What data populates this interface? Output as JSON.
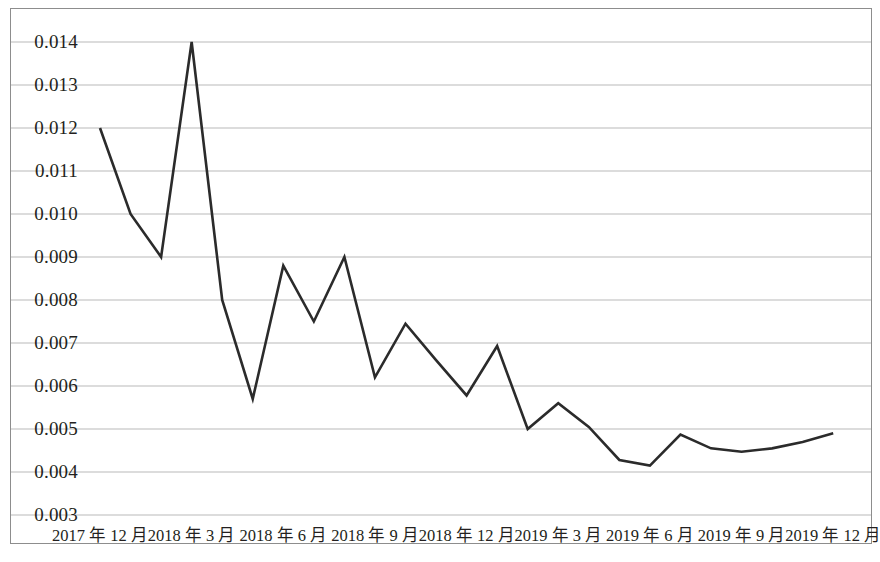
{
  "chart_data": {
    "type": "line",
    "title": "",
    "subtitle": "",
    "xlabel": "",
    "ylabel": "",
    "grid": true,
    "legend": "none",
    "ylim": [
      0.003,
      0.0145
    ],
    "ytick_labels": [
      "0.014",
      "0.013",
      "0.012",
      "0.011",
      "0.010",
      "0.009",
      "0.008",
      "0.007",
      "0.006",
      "0.005",
      "0.004",
      "0.003"
    ],
    "ytick_values": [
      0.014,
      0.013,
      0.012,
      0.011,
      0.01,
      0.009,
      0.008,
      0.007,
      0.006,
      0.005,
      0.004,
      0.003
    ],
    "xtick_labels": [
      "2017 年 12 月",
      "2018 年 3 月",
      "2018 年 6 月",
      "2018 年 9 月",
      "2018 年 12 月",
      "2019 年 3 月",
      "2019 年 6 月",
      "2019 年 9 月",
      "2019 年 12 月"
    ],
    "xtick_indices": [
      0,
      3,
      6,
      9,
      12,
      15,
      18,
      21,
      24
    ],
    "x": [
      "2017-12",
      "2018-01",
      "2018-02",
      "2018-03",
      "2018-04",
      "2018-05",
      "2018-06",
      "2018-07",
      "2018-08",
      "2018-09",
      "2018-10",
      "2018-11",
      "2018-12",
      "2019-01",
      "2019-02",
      "2019-03",
      "2019-04",
      "2019-05",
      "2019-06",
      "2019-07",
      "2019-08",
      "2019-09",
      "2019-10",
      "2019-11",
      "2019-12"
    ],
    "series": [
      {
        "name": "series-1",
        "color": "#2b2b2b",
        "values": [
          0.012,
          0.01,
          0.009,
          0.014,
          0.008,
          0.0057,
          0.0088,
          0.0075,
          0.009,
          0.0062,
          0.00745,
          0.0066,
          0.00578,
          0.00693,
          0.005,
          0.0056,
          0.00505,
          0.00428,
          0.00415,
          0.00487,
          0.00455,
          0.00447,
          0.00455,
          0.0047,
          0.0049
        ]
      }
    ]
  },
  "style": {
    "line_color": "#2b2b2b",
    "grid_color": "#b9b9b9",
    "frame_color": "#8d8d8d",
    "text_color": "#231f20",
    "background": "#ffffff"
  }
}
